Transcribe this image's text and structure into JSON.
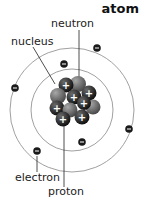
{
  "title": "atom",
  "labels": {
    "neutron": "neutron",
    "nucleus": "nucleus",
    "electron": "electron",
    "proton": "proton"
  },
  "particles": {
    "electron_symbol": "−",
    "proton_symbol": "+"
  },
  "colors": {
    "orbit": "#888888",
    "electron": "#1a1a1a",
    "proton": "#2b2b2b",
    "neutron": "#7a7a7a",
    "leader_line": "#222222"
  },
  "structure": {
    "orbit_count": 2,
    "electrons_inner": 2,
    "electrons_outer": 4,
    "nucleus_particles": 10
  }
}
